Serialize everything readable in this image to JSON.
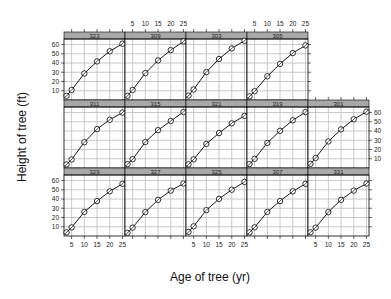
{
  "chart_data": {
    "type": "line",
    "layout": "trellis",
    "title": "",
    "xlabel": "Age of tree (yr)",
    "ylabel": "Height of tree (ft)",
    "xlim": [
      2,
      26
    ],
    "ylim": [
      0,
      66
    ],
    "x_ticks": [
      5,
      10,
      15,
      20,
      25
    ],
    "y_ticks": [
      10,
      20,
      30,
      40,
      50,
      60
    ],
    "grid": true,
    "marker": "circle-with-cross",
    "x": [
      3,
      5,
      10,
      15,
      20,
      25
    ],
    "panels": [
      {
        "label": "323",
        "row": 0,
        "col": 0,
        "values": [
          4.51,
          10.89,
          28.72,
          41.74,
          52.7,
          60.92
        ]
      },
      {
        "label": "309",
        "row": 0,
        "col": 1,
        "values": [
          4.55,
          10.92,
          29.07,
          42.83,
          53.88,
          63.39
        ]
      },
      {
        "label": "303",
        "row": 0,
        "col": 2,
        "values": [
          4.79,
          11.37,
          30.21,
          44.4,
          55.82,
          64.1
        ]
      },
      {
        "label": "305",
        "row": 0,
        "col": 3,
        "values": [
          3.91,
          9.48,
          25.66,
          39.07,
          50.78,
          59.07
        ]
      },
      {
        "label": "311",
        "row": 1,
        "col": 0,
        "values": [
          3.88,
          9.2,
          27.85,
          42.09,
          52.18,
          60.02
        ]
      },
      {
        "label": "315",
        "row": 1,
        "col": 1,
        "values": [
          4.15,
          9.48,
          28.05,
          40.95,
          50.85,
          60.58
        ]
      },
      {
        "label": "321",
        "row": 1,
        "col": 2,
        "values": [
          3.93,
          9.34,
          26.08,
          37.79,
          48.31,
          56.43
        ]
      },
      {
        "label": "319",
        "row": 1,
        "col": 3,
        "values": [
          4.2,
          9.92,
          27.18,
          40.27,
          51.6,
          60.46
        ]
      },
      {
        "label": "301",
        "row": 1,
        "col": 4,
        "values": [
          4.51,
          10.89,
          28.72,
          41.74,
          52.7,
          60.92
        ]
      },
      {
        "label": "329",
        "row": 2,
        "col": 0,
        "values": [
          3.93,
          9.34,
          26.08,
          37.79,
          48.31,
          56.43
        ]
      },
      {
        "label": "327",
        "row": 2,
        "col": 1,
        "values": [
          3.46,
          9.05,
          25.85,
          39.15,
          49.12,
          56.77
        ]
      },
      {
        "label": "325",
        "row": 2,
        "col": 2,
        "values": [
          4.42,
          10.48,
          27.93,
          40.2,
          50.06,
          58.49
        ]
      },
      {
        "label": "307",
        "row": 2,
        "col": 3,
        "values": [
          3.93,
          9.34,
          26.08,
          37.79,
          48.31,
          56.43
        ]
      },
      {
        "label": "331",
        "row": 2,
        "col": 4,
        "values": [
          4.01,
          9.05,
          25.85,
          39.15,
          49.12,
          56.77
        ]
      }
    ]
  },
  "labels": {
    "xlabel": "Age of tree (yr)",
    "ylabel": "Height of tree (ft)"
  },
  "colors": {
    "strip": "#a8a8a8",
    "grid": "#c8c8c8",
    "line": "#000000",
    "panel_border": "#000000"
  }
}
